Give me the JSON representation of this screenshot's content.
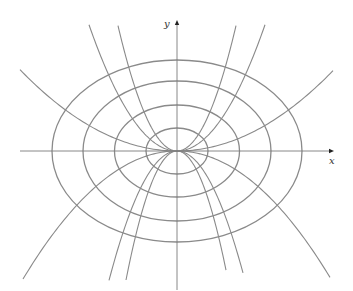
{
  "figure": {
    "width": 353,
    "height": 291,
    "origin": [
      177,
      151
    ],
    "colors": {
      "curve": "#8a8a8a",
      "axis": "#7a7a7a",
      "arrow": "#222222"
    },
    "axes": {
      "x_label": "x",
      "y_label": "y",
      "x_range_px": [
        20,
        331
      ],
      "y_range_px": [
        22,
        290
      ]
    },
    "ellipses": [
      {
        "rx": 31,
        "ry": 23
      },
      {
        "rx": 62.5,
        "ry": 46
      },
      {
        "rx": 94,
        "ry": 70
      },
      {
        "rx": 125,
        "ry": 91
      }
    ],
    "parabolas": [
      {
        "c": 0.0033,
        "side": "left",
        "x_end": 20
      },
      {
        "c": 0.0033,
        "side": "right",
        "x_end": 333
      },
      {
        "c": 0.0163,
        "side": "left",
        "x_end": 89
      },
      {
        "c": 0.0163,
        "side": "right",
        "x_end": 265
      },
      {
        "c": 0.036,
        "side": "left",
        "x_end": 118
      },
      {
        "c": 0.036,
        "side": "right",
        "x_end": 236
      },
      {
        "c": -0.0054,
        "side": "left",
        "x_end": 23
      },
      {
        "c": -0.0054,
        "side": "right",
        "x_end": 330
      },
      {
        "c": -0.028,
        "side": "left",
        "x_end": 109
      },
      {
        "c": -0.028,
        "side": "right",
        "x_end": 243
      },
      {
        "c": -0.0496,
        "side": "left",
        "x_end": 126
      },
      {
        "c": -0.0496,
        "side": "right",
        "x_end": 226
      }
    ]
  }
}
